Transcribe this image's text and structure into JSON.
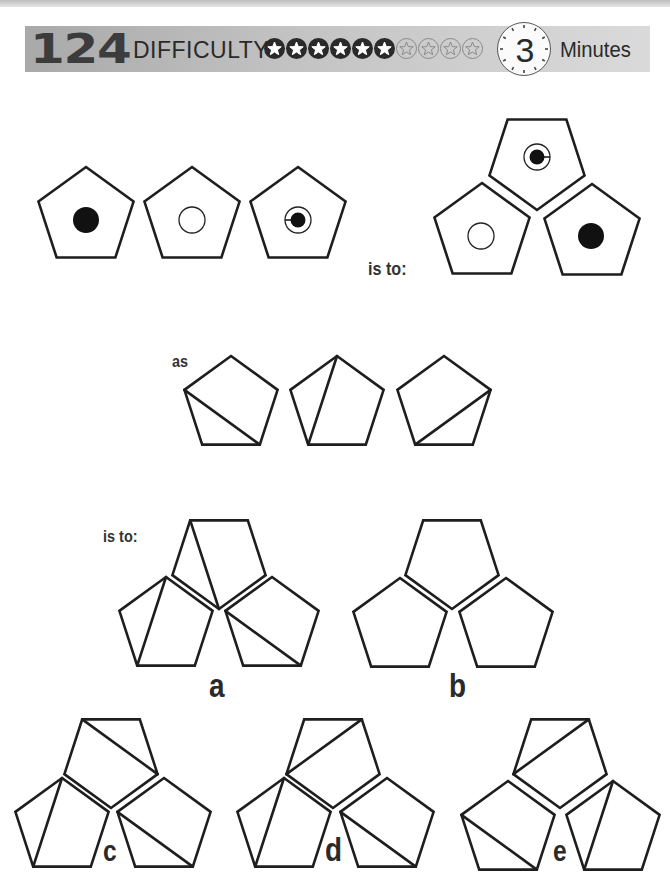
{
  "header": {
    "puzzle_number": "124",
    "difficulty_label": "DIFFICULTY",
    "difficulty": {
      "filled": 6,
      "total": 10
    },
    "timer_value": "3",
    "timer_unit": "Minutes"
  },
  "labels": {
    "is_to_1": "is to:",
    "as": "as",
    "is_to_2": "is to:"
  },
  "colors": {
    "stroke": "#1e1e1e",
    "header_bar": "#b8b8b8",
    "text": "#2a2a2a"
  },
  "figures": {
    "row1": [
      {
        "id": "p1",
        "inner": "filled-dot"
      },
      {
        "id": "p2",
        "inner": "hollow-circle"
      },
      {
        "id": "p3",
        "inner": "ring-with-dot-line-left"
      }
    ],
    "cluster1": {
      "top": {
        "inner": "ring-with-dot-line-right"
      },
      "left": {
        "inner": "hollow-circle"
      },
      "right": {
        "inner": "filled-dot"
      }
    },
    "row2": [
      {
        "id": "q1",
        "diagonal": "left-to-bottom-right"
      },
      {
        "id": "q2",
        "diagonal": "top-to-bottom-left"
      },
      {
        "id": "q3",
        "diagonal": "right-to-bottom-left"
      }
    ]
  },
  "options": [
    {
      "letter": "a",
      "top": "topleft-to-bottom",
      "left": "top-to-bottom-left",
      "right": "left-to-bottom-right"
    },
    {
      "letter": "b",
      "top": "none",
      "left": "none",
      "right": "none"
    },
    {
      "letter": "c",
      "top": "topleft-to-right",
      "left": "top-to-bottom-left",
      "right": "left-to-bottom-right"
    },
    {
      "letter": "d",
      "top": "topright-to-left",
      "left": "top-to-bottom-left",
      "right": "left-to-bottom-right"
    },
    {
      "letter": "e",
      "top": "topright-to-left",
      "left": "left-to-bottom-right",
      "right": "top-to-bottom-left"
    }
  ]
}
